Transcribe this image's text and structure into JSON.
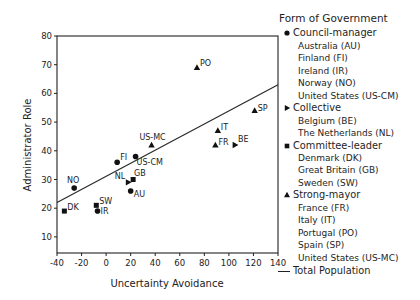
{
  "chart_data": {
    "type": "scatter",
    "title": "",
    "xlabel": "Uncertainty Avoidance",
    "ylabel": "Administrator Role",
    "xlim": [
      -40,
      140
    ],
    "ylim": [
      4,
      80
    ],
    "x_ticks": [
      -40,
      -20,
      0,
      20,
      40,
      60,
      80,
      100,
      120,
      140
    ],
    "y_ticks": [
      10,
      20,
      30,
      40,
      50,
      60,
      70,
      80
    ],
    "grid": false,
    "legend_position": "right",
    "legend_title": "Form of Government",
    "series": [
      {
        "name": "Council-manager",
        "marker": "circle",
        "points": [
          {
            "label": "AU",
            "x": 20,
            "y": 26
          },
          {
            "label": "FI",
            "x": 9,
            "y": 36
          },
          {
            "label": "IR",
            "x": -7,
            "y": 19
          },
          {
            "label": "NO",
            "x": -26,
            "y": 27
          },
          {
            "label": "US-CM",
            "x": 24,
            "y": 38
          }
        ]
      },
      {
        "name": "Collective",
        "marker": "triangle-right",
        "points": [
          {
            "label": "BE",
            "x": 105,
            "y": 42
          },
          {
            "label": "NL",
            "x": 18,
            "y": 29
          }
        ]
      },
      {
        "name": "Committee-leader",
        "marker": "square",
        "points": [
          {
            "label": "DK",
            "x": -34,
            "y": 19
          },
          {
            "label": "GB",
            "x": 22,
            "y": 30
          },
          {
            "label": "SW",
            "x": -8,
            "y": 21
          }
        ]
      },
      {
        "name": "Strong-mayor",
        "marker": "triangle-up",
        "points": [
          {
            "label": "FR",
            "x": 89,
            "y": 42
          },
          {
            "label": "IT",
            "x": 91,
            "y": 47
          },
          {
            "label": "PO",
            "x": 74,
            "y": 69
          },
          {
            "label": "SP",
            "x": 121,
            "y": 54
          },
          {
            "label": "US-MC",
            "x": 37,
            "y": 42
          }
        ]
      }
    ],
    "regression_line": {
      "name": "Total Population",
      "x": [
        -40,
        140
      ],
      "y": [
        22,
        63
      ]
    }
  },
  "legend": {
    "title": "Form of Government",
    "groups": [
      {
        "label": "Council-manager",
        "marker": "circle",
        "items": [
          "Australia (AU)",
          "Finland (FI)",
          "Ireland (IR)",
          "Norway (NO)",
          "United States (US-CM)"
        ]
      },
      {
        "label": "Collective",
        "marker": "triangle-right",
        "items": [
          "Belgium (BE)",
          "The Netherlands (NL)"
        ]
      },
      {
        "label": "Committee-leader",
        "marker": "square",
        "items": [
          "Denmark (DK)",
          "Great Britain (GB)",
          "Sweden (SW)"
        ]
      },
      {
        "label": "Strong-mayor",
        "marker": "triangle-up",
        "items": [
          "France (FR)",
          "Italy (IT)",
          "Portugal (PO)",
          "Spain (SP)",
          "United States (US-MC)"
        ]
      }
    ],
    "total_label": "Total Population"
  }
}
